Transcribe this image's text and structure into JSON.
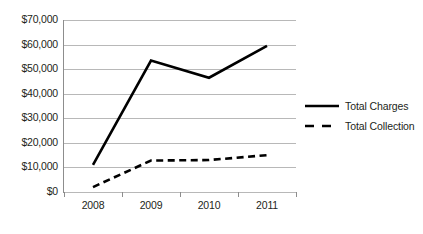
{
  "chart_data": {
    "type": "line",
    "title": "",
    "subtitle": "",
    "xlabel": "",
    "ylabel": "",
    "categories": [
      "2008",
      "2009",
      "2010",
      "2011"
    ],
    "series": [
      {
        "name": "Total Charges",
        "style": "solid",
        "color": "#000000",
        "values": [
          11000,
          53500,
          46500,
          59500
        ]
      },
      {
        "name": "Total Collection",
        "style": "dashed",
        "color": "#000000",
        "values": [
          2000,
          12800,
          13000,
          15000
        ]
      }
    ],
    "ylim": [
      0,
      70000
    ],
    "ytick_values": [
      0,
      10000,
      20000,
      30000,
      40000,
      50000,
      60000,
      70000
    ],
    "ytick_labels": [
      "$0",
      "$10,000",
      "$20,000",
      "$30,000",
      "$40,000",
      "$50,000",
      "$60,000",
      "$70,000"
    ],
    "grid": "horizontal",
    "legend_position": "right",
    "legend_entries": [
      "Total Charges",
      "Total Collection"
    ],
    "axis_color": "#8d8d8d",
    "gridline_color": "#b8b8b8",
    "background_color": "#ffffff"
  },
  "legend": {
    "items": [
      {
        "label": "Total Charges",
        "style": "solid"
      },
      {
        "label": "Total Collection",
        "style": "dashed"
      }
    ]
  },
  "caption": {
    "cut_off_text": ""
  }
}
